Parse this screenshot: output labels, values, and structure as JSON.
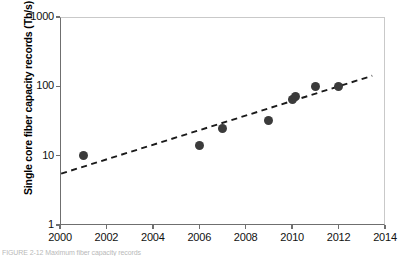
{
  "chart_data": {
    "type": "scatter",
    "title": "",
    "xlabel": "",
    "ylabel": "Single core fiber capacity records (Tb/s)",
    "xlim": [
      2000,
      2014
    ],
    "ylim": [
      1,
      1000
    ],
    "yscale": "log",
    "grid": false,
    "legend": "none",
    "x_ticks": [
      "2000",
      "2002",
      "2004",
      "2006",
      "2008",
      "2010",
      "2012",
      "2014"
    ],
    "x_tick_values": [
      2000,
      2002,
      2004,
      2006,
      2008,
      2010,
      2012,
      2014
    ],
    "y_ticks": [
      "1",
      "10",
      "100",
      "1000"
    ],
    "y_tick_values": [
      1,
      10,
      100,
      1000
    ],
    "series": [
      {
        "name": "Single core fiber capacity records",
        "marker": "filled-circle",
        "color": "#3b3b3b",
        "points": [
          {
            "x": 2001,
            "y": 10.2
          },
          {
            "x": 2006,
            "y": 14
          },
          {
            "x": 2007,
            "y": 25
          },
          {
            "x": 2009,
            "y": 32
          },
          {
            "x": 2010,
            "y": 65
          },
          {
            "x": 2010.15,
            "y": 72
          },
          {
            "x": 2011,
            "y": 100
          },
          {
            "x": 2012,
            "y": 98
          }
        ]
      }
    ],
    "trend_line": {
      "name": "exponential growth trend",
      "style": "dashed",
      "color": "#1a1a1a",
      "x_start": 2000.05,
      "y_start": 5.5,
      "x_end": 2013.45,
      "y_end": 142
    }
  },
  "caption": {
    "text": "FIGURE 2-12   Maximum fiber capacity records"
  },
  "colors": {
    "marker": "#3b3b3b",
    "trend": "#1a1a1a",
    "axis": "#6f6f6f",
    "frame": "#c9c9c9",
    "background": "#ffffff"
  }
}
